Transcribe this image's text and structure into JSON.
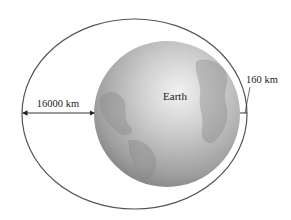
{
  "diagram": {
    "earth_label": "Earth",
    "apogee_label": "16000 km",
    "perigee_label": "160 km",
    "colors": {
      "orbit": "#555555",
      "earth_light": "#d8d8d8",
      "earth_dark": "#7a7a7a",
      "text": "#222222"
    }
  }
}
